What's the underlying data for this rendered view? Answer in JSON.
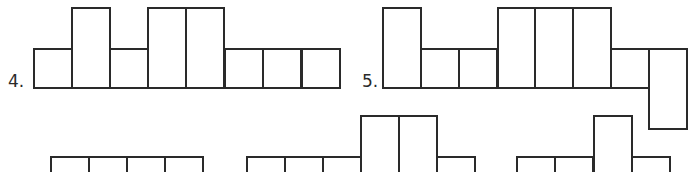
{
  "figures": [
    {
      "label": "4.",
      "label_pos": [
        8,
        73
      ],
      "cells": [
        {
          "x": 33,
          "y": 48,
          "w": 40,
          "h": 41
        },
        {
          "x": 71,
          "y": 7,
          "w": 40,
          "h": 82
        },
        {
          "x": 109,
          "y": 48,
          "w": 40,
          "h": 41
        },
        {
          "x": 147,
          "y": 7,
          "w": 40,
          "h": 82
        },
        {
          "x": 185,
          "y": 7,
          "w": 40,
          "h": 82
        },
        {
          "x": 224,
          "y": 48,
          "w": 40,
          "h": 41
        },
        {
          "x": 262,
          "y": 48,
          "w": 40,
          "h": 41
        },
        {
          "x": 301,
          "y": 48,
          "w": 40,
          "h": 41
        }
      ]
    },
    {
      "label": "5.",
      "label_pos": [
        362,
        73
      ],
      "cells": [
        {
          "x": 382,
          "y": 7,
          "w": 40,
          "h": 82
        },
        {
          "x": 420,
          "y": 48,
          "w": 40,
          "h": 41
        },
        {
          "x": 458,
          "y": 48,
          "w": 40,
          "h": 41
        },
        {
          "x": 497,
          "y": 7,
          "w": 40,
          "h": 82
        },
        {
          "x": 534,
          "y": 7,
          "w": 40,
          "h": 82
        },
        {
          "x": 572,
          "y": 7,
          "w": 40,
          "h": 82
        },
        {
          "x": 610,
          "y": 48,
          "w": 40,
          "h": 41
        },
        {
          "x": 648,
          "y": 48,
          "w": 40,
          "h": 82
        }
      ]
    },
    {
      "label": "",
      "cells": [
        {
          "x": 50,
          "y": 156,
          "w": 40,
          "h": 30
        },
        {
          "x": 88,
          "y": 156,
          "w": 40,
          "h": 30
        },
        {
          "x": 126,
          "y": 156,
          "w": 40,
          "h": 30
        },
        {
          "x": 164,
          "y": 156,
          "w": 40,
          "h": 30
        }
      ]
    },
    {
      "label": "",
      "cells": [
        {
          "x": 246,
          "y": 156,
          "w": 40,
          "h": 30
        },
        {
          "x": 284,
          "y": 156,
          "w": 40,
          "h": 30
        },
        {
          "x": 322,
          "y": 156,
          "w": 40,
          "h": 30
        },
        {
          "x": 360,
          "y": 115,
          "w": 40,
          "h": 71
        },
        {
          "x": 398,
          "y": 115,
          "w": 40,
          "h": 71
        },
        {
          "x": 436,
          "y": 156,
          "w": 40,
          "h": 30
        }
      ]
    },
    {
      "label": "",
      "cells": [
        {
          "x": 516,
          "y": 156,
          "w": 40,
          "h": 30
        },
        {
          "x": 554,
          "y": 156,
          "w": 40,
          "h": 30
        },
        {
          "x": 593,
          "y": 115,
          "w": 40,
          "h": 71
        },
        {
          "x": 631,
          "y": 156,
          "w": 40,
          "h": 30
        }
      ]
    }
  ]
}
